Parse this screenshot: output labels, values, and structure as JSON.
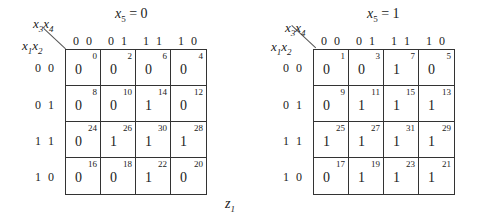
{
  "diagram": {
    "type": "karnaugh-map-5-variable",
    "function_label": "z",
    "function_sub": "1",
    "row_var_label": {
      "a": "x",
      "as": "1",
      "b": "x",
      "bs": "2"
    },
    "col_var_label": {
      "a": "x",
      "as": "3",
      "b": "x",
      "bs": "4"
    },
    "col_headers": [
      "0 0",
      "0 1",
      "1 1",
      "1 0"
    ],
    "row_headers": [
      "0 0",
      "0 1",
      "1 1",
      "1 0"
    ],
    "maps": [
      {
        "title_var": "x",
        "title_sub": "5",
        "title_eq": " = 0",
        "cells": [
          [
            {
              "idx": "0",
              "val": "0"
            },
            {
              "idx": "2",
              "val": "0"
            },
            {
              "idx": "6",
              "val": "0"
            },
            {
              "idx": "4",
              "val": "0"
            }
          ],
          [
            {
              "idx": "8",
              "val": "0"
            },
            {
              "idx": "10",
              "val": "0"
            },
            {
              "idx": "14",
              "val": "1"
            },
            {
              "idx": "12",
              "val": "0"
            }
          ],
          [
            {
              "idx": "24",
              "val": "0"
            },
            {
              "idx": "26",
              "val": "1"
            },
            {
              "idx": "30",
              "val": "1"
            },
            {
              "idx": "28",
              "val": "1"
            }
          ],
          [
            {
              "idx": "16",
              "val": "0"
            },
            {
              "idx": "18",
              "val": "0"
            },
            {
              "idx": "22",
              "val": "1"
            },
            {
              "idx": "20",
              "val": "0"
            }
          ]
        ]
      },
      {
        "title_var": "x",
        "title_sub": "5",
        "title_eq": " = 1",
        "cells": [
          [
            {
              "idx": "1",
              "val": "0"
            },
            {
              "idx": "3",
              "val": "0"
            },
            {
              "idx": "7",
              "val": "1"
            },
            {
              "idx": "5",
              "val": "0"
            }
          ],
          [
            {
              "idx": "9",
              "val": "0"
            },
            {
              "idx": "11",
              "val": "1"
            },
            {
              "idx": "15",
              "val": "1"
            },
            {
              "idx": "13",
              "val": "1"
            }
          ],
          [
            {
              "idx": "25",
              "val": "1"
            },
            {
              "idx": "27",
              "val": "1"
            },
            {
              "idx": "31",
              "val": "1"
            },
            {
              "idx": "29",
              "val": "1"
            }
          ],
          [
            {
              "idx": "17",
              "val": "0"
            },
            {
              "idx": "19",
              "val": "1"
            },
            {
              "idx": "23",
              "val": "1"
            },
            {
              "idx": "21",
              "val": "1"
            }
          ]
        ]
      }
    ]
  }
}
